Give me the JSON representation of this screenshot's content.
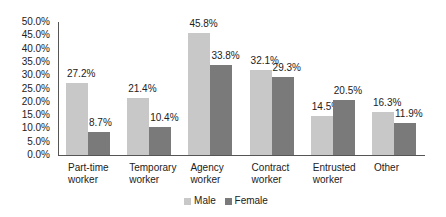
{
  "chart_data": {
    "type": "bar",
    "title": "",
    "xlabel": "",
    "ylabel": "",
    "ylim": [
      0,
      50
    ],
    "yticks": [
      "0.0%",
      "5.0%",
      "10.0%",
      "15.0%",
      "20.0%",
      "25.0%",
      "30.0%",
      "35.0%",
      "40.0%",
      "45.0%",
      "50.0%"
    ],
    "grid": false,
    "legend_position": "bottom",
    "categories": [
      [
        "Part-time",
        "worker"
      ],
      [
        "Temporary",
        "worker"
      ],
      [
        "Agency",
        "worker"
      ],
      [
        "Contract",
        "worker"
      ],
      [
        "Entrusted",
        "worker"
      ],
      [
        "Other"
      ]
    ],
    "series": [
      {
        "name": "Male",
        "color": "#c8c8c8",
        "values": [
          27.2,
          21.4,
          45.8,
          32.1,
          14.5,
          16.3
        ],
        "labels": [
          "27.2%",
          "21.4%",
          "45.8%",
          "32.1%",
          "14.5%",
          "16.3%"
        ]
      },
      {
        "name": "Female",
        "color": "#7a7a7a",
        "values": [
          8.7,
          10.4,
          33.8,
          29.3,
          20.5,
          11.9
        ],
        "labels": [
          "8.7%",
          "10.4%",
          "33.8%",
          "29.3%",
          "20.5%",
          "11.9%"
        ]
      }
    ]
  }
}
